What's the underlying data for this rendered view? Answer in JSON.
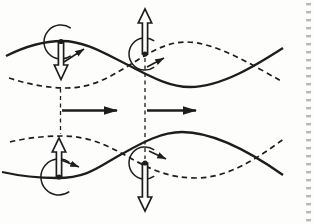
{
  "canvas": {
    "width": 314,
    "height": 224,
    "paper": "#fdfdfc",
    "ink": "#1d1d1d",
    "arrow_fill": "#ffffff"
  },
  "waves": [
    {
      "name": "top-wave-solid",
      "style": "solid",
      "path": "M 6 56 C 24 47 44 41 62 41 C 84 41 104 53 126 64 C 148 75 168 87 190 87 C 222 87 258 64 283 48"
    },
    {
      "name": "top-wave-dashed",
      "style": "dashed",
      "path": "M 9 78 C 27 84 48 88 66 88 C 92 88 110 77 128 66 C 146 55 164 42 186 42 C 216 42 254 66 283 82"
    },
    {
      "name": "bottom-wave-dashed",
      "style": "dashed",
      "path": "M 10 142 C 26 138 45 136 62 136 C 92 136 112 148 132 159 C 152 170 170 178 196 178 C 228 178 258 158 285 138"
    },
    {
      "name": "bottom-wave-solid",
      "style": "solid",
      "path": "M 2 172 C 20 176 40 178 57 178 C 88 178 100 166 120 155 C 140 144 160 132 182 132 C 216 132 256 156 283 175"
    }
  ],
  "guide_lines": [
    {
      "name": "left-phase-guide",
      "x": 60.5,
      "y1": 88.5,
      "y2": 134
    },
    {
      "name": "right-phase-guide",
      "x": 145,
      "y1": 58,
      "y2": 159
    }
  ],
  "flow_arrows": [
    {
      "name": "left-propagation-arrow",
      "x1": 62,
      "x2": 117,
      "y": 110.5
    },
    {
      "name": "right-propagation-arrow",
      "x1": 147,
      "x2": 196,
      "y": 110.5
    }
  ],
  "vortices": [
    {
      "name": "top-left-vortex",
      "spin": "counterclockwise",
      "dot": {
        "x": 61,
        "y": 41.5
      },
      "arc": "M 70.8 28.1 A 17 17 0 1 0 70.8 55.9",
      "open_arrow": "M 58.4 42 L 58.4 65 L 54.3 65 L 61 79.5 L 67.7 65 L 63.6 65 L 63.6 42 Z",
      "tangent": {
        "x1": 64,
        "y1": 62,
        "x2": 84,
        "y2": 49
      }
    },
    {
      "name": "top-center-vortex",
      "spin": "counterclockwise",
      "dot": {
        "x": 145,
        "y": 54
      },
      "arc": "M 154.2 40.9 A 16 16 0 1 0 154.2 67.1",
      "open_arrow": "M 142.4 54 L 142.4 23 L 138.3 23 L 145 9 L 151.7 23 L 147.6 23 L 147.6 54 Z",
      "tangent": {
        "x1": 147,
        "y1": 67,
        "x2": 164,
        "y2": 58
      }
    },
    {
      "name": "bottom-left-vortex",
      "spin": "clockwise",
      "dot": {
        "x": 59,
        "y": 177
      },
      "arc": "M 69.3 162.3 A 18 18 0 1 0 69.3 191.7",
      "open_arrow": "M 56.4 177 L 56.4 152 L 52.3 152 L 59 138 L 65.7 152 L 61.6 152 L 61.6 177 Z",
      "tangent": {
        "x1": 61,
        "y1": 160,
        "x2": 79,
        "y2": 167
      }
    },
    {
      "name": "bottom-center-vortex",
      "spin": "clockwise",
      "dot": {
        "x": 145,
        "y": 163
      },
      "arc": "M 154.2 149.9 A 16 16 0 1 0 154.2 176.1",
      "open_arrow": "M 142.4 163 L 142.4 197 L 138.3 197 L 145 211 L 151.7 197 L 147.6 197 L 147.6 163 Z",
      "tangent": {
        "x1": 149,
        "y1": 151,
        "x2": 166,
        "y2": 159
      }
    }
  ],
  "page_edge": {
    "x": 306,
    "dash_width": 5,
    "dash_height": 2.4,
    "start_y": 3,
    "end_y": 222,
    "spacing": 8,
    "color": "#a9a9a9"
  }
}
